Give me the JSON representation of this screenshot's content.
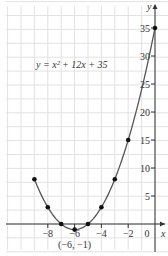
{
  "chart_data": {
    "type": "line",
    "title": "",
    "equation_label": "y = x² + 12x + 35",
    "xlabel": "x",
    "ylabel": "y",
    "x_ticks": [
      -8,
      -6,
      -4,
      -2,
      0
    ],
    "x_tick_labels": [
      "−8",
      "−6",
      "−4",
      "−2",
      "0"
    ],
    "y_ticks": [
      5,
      10,
      15,
      20,
      25,
      30,
      35
    ],
    "y_tick_labels": [
      "5",
      "10",
      "15",
      "20",
      "25",
      "30",
      "35"
    ],
    "xlim": [
      -11,
      1
    ],
    "ylim": [
      -4,
      40
    ],
    "grid": true,
    "series": [
      {
        "name": "y = x^2 + 12x + 35",
        "points": [
          {
            "x": -9,
            "y": 8
          },
          {
            "x": -8,
            "y": 3
          },
          {
            "x": -7,
            "y": 0
          },
          {
            "x": -6,
            "y": -1
          },
          {
            "x": -5,
            "y": 0
          },
          {
            "x": -4,
            "y": 3
          },
          {
            "x": -3,
            "y": 8
          },
          {
            "x": -2,
            "y": 15
          },
          {
            "x": 0,
            "y": 35
          }
        ]
      }
    ],
    "annotations": [
      {
        "text": "(−6, −1)",
        "x": -6,
        "y": -1,
        "position": "below"
      }
    ],
    "colors": {
      "curve": "#555555",
      "points": "#111111",
      "grid": "#e2e2e2",
      "axis": "#333333"
    }
  }
}
